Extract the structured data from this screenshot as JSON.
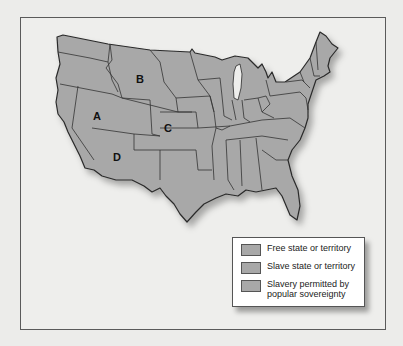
{
  "map": {
    "fill_color": "#a8a8a8",
    "border_color": "#3a3a3a",
    "background_color": "#eeeeec",
    "region_labels": [
      {
        "id": "A",
        "label": "A",
        "x": 97,
        "y": 116
      },
      {
        "id": "B",
        "label": "B",
        "x": 140,
        "y": 79
      },
      {
        "id": "C",
        "label": "C",
        "x": 168,
        "y": 128
      },
      {
        "id": "D",
        "label": "D",
        "x": 117,
        "y": 157
      }
    ]
  },
  "legend": {
    "items": [
      {
        "label": "Free state or territory",
        "color": "#a8a8a8"
      },
      {
        "label": "Slave state or territory",
        "color": "#a8a8a8"
      },
      {
        "label": "Slavery permitted by popular sovereignty",
        "color": "#a8a8a8"
      }
    ]
  }
}
